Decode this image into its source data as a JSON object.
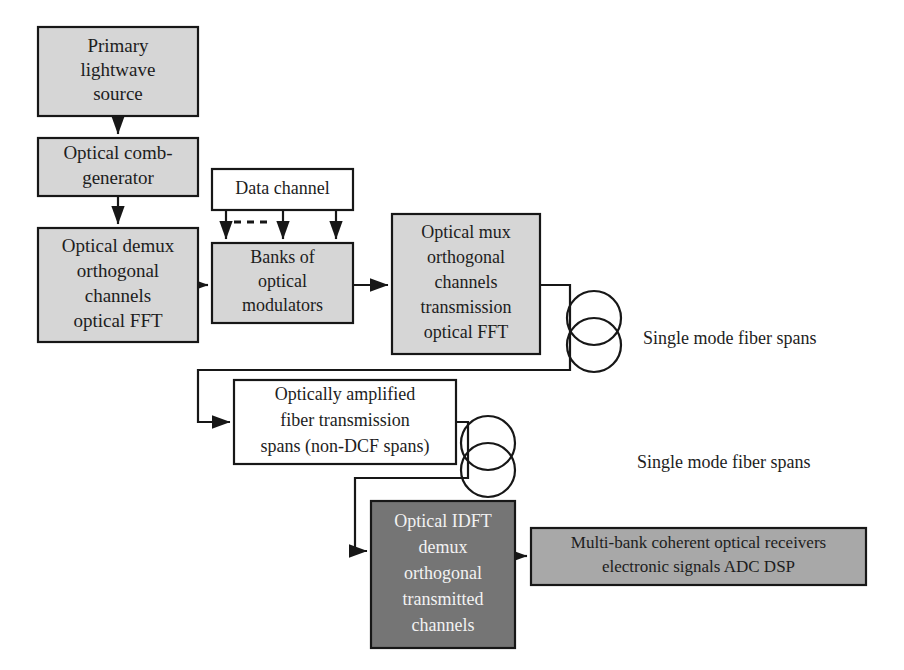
{
  "diagram": {
    "colors": {
      "light_gray_fill": "#d6d6d6",
      "white_fill": "#ffffff",
      "medium_gray_fill": "#a8a8a8",
      "dark_gray_fill": "#757575",
      "stroke": "#171717",
      "dark_text": "#1d1d1d",
      "light_text": "#f2f2f2",
      "background": "#ffffff"
    },
    "nodes": [
      {
        "id": "primary-lightwave-source",
        "name": "primary-lightwave-source-box",
        "lines": [
          "Primary",
          "lightwave",
          "source"
        ],
        "x": 38,
        "y": 27,
        "w": 160,
        "h": 89,
        "fill": "#d6d6d6",
        "text_color": "#1d1d1d",
        "font_size": 19,
        "line_height": 24
      },
      {
        "id": "optical-comb-generator",
        "name": "optical-comb-generator-box",
        "lines": [
          "Optical comb-",
          "generator"
        ],
        "x": 38,
        "y": 138,
        "w": 160,
        "h": 58,
        "fill": "#d6d6d6",
        "text_color": "#1d1d1d",
        "font_size": 19,
        "line_height": 25
      },
      {
        "id": "optical-demux",
        "name": "optical-demux-box",
        "lines": [
          "Optical demux",
          "orthogonal",
          "channels",
          "optical FFT"
        ],
        "x": 38,
        "y": 228,
        "w": 160,
        "h": 114,
        "fill": "#d6d6d6",
        "text_color": "#1d1d1d",
        "font_size": 19,
        "line_height": 25
      },
      {
        "id": "data-channel",
        "name": "data-channel-box",
        "lines": [
          "Data channel"
        ],
        "x": 212,
        "y": 169,
        "w": 141,
        "h": 41,
        "fill": "#ffffff",
        "text_color": "#1d1d1d",
        "font_size": 18,
        "line_height": 22
      },
      {
        "id": "banks-of-optical-modulators",
        "name": "banks-of-optical-modulators-box",
        "lines": [
          "Banks of",
          "optical",
          "modulators"
        ],
        "x": 212,
        "y": 243,
        "w": 141,
        "h": 80,
        "fill": "#d6d6d6",
        "text_color": "#1d1d1d",
        "font_size": 18,
        "line_height": 24
      },
      {
        "id": "optical-mux",
        "name": "optical-mux-box",
        "lines": [
          "Optical mux",
          "orthogonal",
          "channels",
          "transmission",
          "optical FFT"
        ],
        "x": 392,
        "y": 214,
        "w": 148,
        "h": 140,
        "fill": "#d6d6d6",
        "text_color": "#1d1d1d",
        "font_size": 18,
        "line_height": 25
      },
      {
        "id": "optically-amplified-spans",
        "name": "optically-amplified-fiber-transmission-box",
        "lines": [
          "Optically amplified",
          "fiber transmission",
          "spans (non-DCF spans)"
        ],
        "x": 234,
        "y": 380,
        "w": 222,
        "h": 84,
        "fill": "#ffffff",
        "text_color": "#1d1d1d",
        "font_size": 18,
        "line_height": 26
      },
      {
        "id": "optical-idft-demux",
        "name": "optical-idft-demux-box",
        "lines": [
          "Optical IDFT",
          "demux",
          "orthogonal",
          "transmitted",
          "channels"
        ],
        "x": 371,
        "y": 501,
        "w": 144,
        "h": 147,
        "fill": "#757575",
        "text_color": "#f2f2f2",
        "font_size": 18,
        "line_height": 26
      },
      {
        "id": "multi-bank-receivers",
        "name": "multi-bank-coherent-optical-receivers-box",
        "lines": [
          "Multi-bank coherent optical receivers",
          "electronic signals    ADC    DSP"
        ],
        "x": 531,
        "y": 528,
        "w": 335,
        "h": 57,
        "fill": "#a8a8a8",
        "text_color": "#1d1d1d",
        "font_size": 17,
        "line_height": 24
      }
    ],
    "annotations": [
      {
        "id": "fiber-spans-label-top",
        "name": "single-mode-fiber-spans-label-top",
        "text": "Single mode fiber spans",
        "x": 643,
        "y": 340,
        "font_size": 18
      },
      {
        "id": "fiber-spans-label-bottom",
        "name": "single-mode-fiber-spans-label-bottom",
        "text": "Single mode fiber spans",
        "x": 637,
        "y": 464,
        "font_size": 18
      }
    ],
    "fiber_spools": [
      {
        "id": "fiber-spool-top",
        "name": "fiber-spool-symbol-top",
        "cx": 594,
        "cy_upper": 318,
        "cy_lower": 345,
        "r": 27
      },
      {
        "id": "fiber-spool-bottom",
        "name": "fiber-spool-symbol-bottom",
        "cx": 488,
        "cy_upper": 443,
        "cy_lower": 470,
        "r": 27
      }
    ],
    "connectors": [
      {
        "id": "source-to-comb",
        "name": "connector-source-to-comb-generator",
        "points": "118,116 118,134",
        "arrow": true
      },
      {
        "id": "comb-to-demux",
        "name": "connector-comb-generator-to-demux",
        "points": "118,196 118,224",
        "arrow": true
      },
      {
        "id": "demux-to-modulators",
        "name": "connector-demux-to-modulators",
        "points": "198,285 208,285",
        "arrow": true
      },
      {
        "id": "data-channel-tap-1",
        "name": "connector-data-channel-to-modulators-1",
        "points": "226,210 226,239",
        "arrow": true
      },
      {
        "id": "data-channel-tap-2",
        "name": "connector-data-channel-to-modulators-2",
        "points": "283,210 283,239",
        "arrow": true
      },
      {
        "id": "data-channel-tap-3",
        "name": "connector-data-channel-to-modulators-3",
        "points": "336,210 336,239",
        "arrow": true
      },
      {
        "id": "modulators-to-mux",
        "name": "connector-modulators-to-mux",
        "points": "353,285 388,285",
        "arrow": true
      },
      {
        "id": "mux-to-amplified-spans",
        "name": "connector-mux-to-amplified-spans",
        "points": "540,285 570,285 570,370 198,370 198,422 230,422",
        "arrow": true
      },
      {
        "id": "amplified-spans-to-idft",
        "name": "connector-amplified-spans-to-idft",
        "points": "456,422 468,422 468,478 355,478 355,551 367,551",
        "arrow": true
      },
      {
        "id": "idft-to-receivers",
        "name": "connector-idft-to-receivers",
        "points": "515,556 527,556",
        "arrow": true
      }
    ],
    "dashed_marker": {
      "id": "data-channel-dashed-marker",
      "name": "data-channel-dashed-segment",
      "points": "234,222 272,222"
    }
  }
}
